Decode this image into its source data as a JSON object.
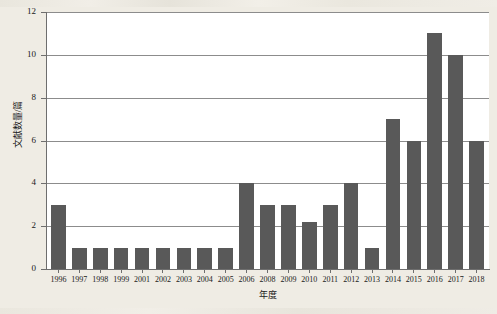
{
  "chart_data": {
    "type": "bar",
    "title": "",
    "xlabel": "年度",
    "ylabel": "文献数量/篇",
    "ylim": [
      0,
      12
    ],
    "ytick_values": [
      0,
      2,
      4,
      6,
      8,
      10,
      12
    ],
    "ytick_labels": [
      "0",
      "2",
      "4",
      "6",
      "8",
      "10",
      "12"
    ],
    "grid": "horizontal",
    "legend": "none",
    "bar_color": "#595959",
    "plot_background": "#ffffff",
    "page_background": "#efece4",
    "axis_color": "#6e6e6e",
    "gridline_color": "#8c8c8c",
    "categories": [
      "1996",
      "1997",
      "1998",
      "1999",
      "2001",
      "2002",
      "2003",
      "2004",
      "2005",
      "2006",
      "2008",
      "2009",
      "2010",
      "2011",
      "2012",
      "2013",
      "2014",
      "2015",
      "2016",
      "2017",
      "2018"
    ],
    "values": [
      3,
      1,
      1,
      1,
      1,
      1,
      1,
      1,
      1,
      4,
      3,
      3,
      2.2,
      3,
      4,
      1,
      7,
      6,
      11,
      10,
      6
    ]
  }
}
